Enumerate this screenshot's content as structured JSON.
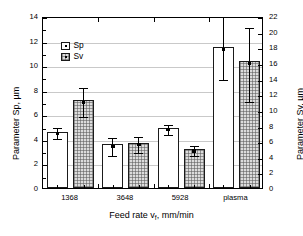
{
  "chart_data": {
    "type": "bar",
    "title": "",
    "subtitle": "",
    "xlabel": "Feed rate v",
    "xlabel_sub": "f",
    "xlabel_tail": ", mm/min",
    "ylabel_left": "Parameter Sp, µm",
    "ylabel_right": "Parameter Sv, µm",
    "categories": [
      "1368",
      "3648",
      "5928",
      "plasma"
    ],
    "ylim_left": [
      0,
      14
    ],
    "ylim_right": [
      0,
      22
    ],
    "yticks_left": [
      "0",
      "2",
      "4",
      "6",
      "8",
      "10",
      "12",
      "14"
    ],
    "yticks_right": [
      "0",
      "2",
      "4",
      "6",
      "8",
      "10",
      "12",
      "14",
      "16",
      "18",
      "20",
      "22"
    ],
    "grid": true,
    "legend_position": "upper-left",
    "series": [
      {
        "name": "Sp",
        "axis": "left",
        "style": "open",
        "values": [
          4.6,
          3.55,
          4.9,
          11.45
        ],
        "err_low": [
          0.45,
          0.75,
          0.45,
          2.5
        ],
        "err_high": [
          0.45,
          0.7,
          0.4,
          2.6
        ]
      },
      {
        "name": "Sv",
        "axis": "right",
        "style": "hatched",
        "values": [
          11.2,
          5.8,
          5.0,
          16.2
        ],
        "err_low": [
          1.9,
          1.1,
          0.6,
          4.9
        ],
        "err_high": [
          1.9,
          1.0,
          0.6,
          4.5
        ]
      }
    ]
  },
  "legend": {
    "items": [
      {
        "label": "Sp",
        "style": "open"
      },
      {
        "label": "Sv",
        "style": "hatched"
      }
    ]
  }
}
